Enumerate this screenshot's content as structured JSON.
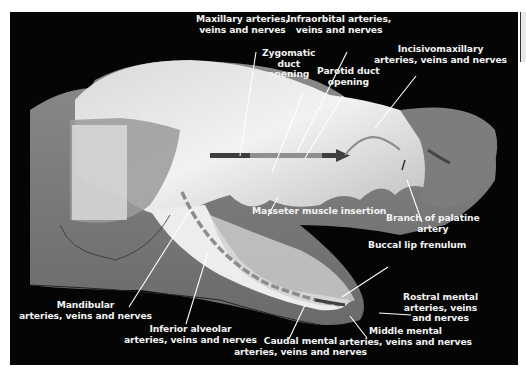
{
  "figure": {
    "colors": {
      "background": "#050505",
      "bone": "#e6e6e6",
      "soft_tissue": "#7a7a7a",
      "vessel_line": "#8a8a8a",
      "arrow_dark": "#3e3e3e",
      "label_text": "#f2f2f2",
      "leader_line": "#ffffff"
    },
    "labels": [
      {
        "id": "maxillary",
        "lines": [
          "Maxillary arteries,",
          "veins and nerves"
        ]
      },
      {
        "id": "infraorbital",
        "lines": [
          "Infraorbital arteries,",
          "veins and nerves"
        ]
      },
      {
        "id": "zygomatic",
        "lines": [
          "Zygomatic",
          "duct",
          "opening"
        ]
      },
      {
        "id": "parotid",
        "lines": [
          "Parotid duct",
          "opening"
        ]
      },
      {
        "id": "incisivomaxillary",
        "lines": [
          "Incisivomaxillary",
          "arteries, veins and nerves"
        ]
      },
      {
        "id": "masseter",
        "lines": [
          "Masseter muscle insertion"
        ]
      },
      {
        "id": "palatine",
        "lines": [
          "Branch of palatine",
          "artery"
        ]
      },
      {
        "id": "buccal",
        "lines": [
          "Buccal lip frenulum"
        ]
      },
      {
        "id": "rostral-mental",
        "lines": [
          "Rostral mental",
          "arteries, veins",
          "and nerves"
        ]
      },
      {
        "id": "middle-mental",
        "lines": [
          "Middle mental",
          "arteries, veins and nerves"
        ]
      },
      {
        "id": "caudal-mental",
        "lines": [
          "Caudal mental",
          "arteries, veins and nerves"
        ]
      },
      {
        "id": "inferior-alveolar",
        "lines": [
          "Inferior alveolar",
          "arteries, veins and nerves"
        ]
      },
      {
        "id": "mandibular",
        "lines": [
          "Mandibular",
          "arteries, veins and nerves"
        ]
      }
    ]
  }
}
